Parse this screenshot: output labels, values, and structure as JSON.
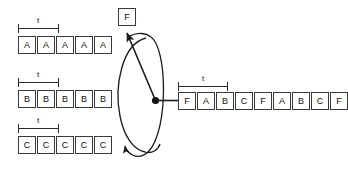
{
  "diagram": {
    "background_color": "#ffffff",
    "stroke_color": "#2b2b2b",
    "box_fill": "#ffffff",
    "period_label": "t"
  },
  "input_channels": [
    {
      "name": "channel-a",
      "symbol": "A",
      "cells": [
        "A",
        "A",
        "A",
        "A",
        "A"
      ],
      "bracket_label": "t"
    },
    {
      "name": "channel-b",
      "symbol": "B",
      "cells": [
        "B",
        "B",
        "B",
        "B",
        "B"
      ],
      "bracket_label": "t"
    },
    {
      "name": "channel-c",
      "symbol": "C",
      "cells": [
        "C",
        "C",
        "C",
        "C",
        "C"
      ],
      "bracket_label": "t"
    }
  ],
  "commutator": {
    "name": "rotating-switch",
    "frame_label": "F",
    "hub_label": "",
    "rotation_arrows": 2
  },
  "output_stream": {
    "name": "multiplexed-output",
    "cells": [
      "F",
      "A",
      "B",
      "C",
      "F",
      "A",
      "B",
      "C",
      "F"
    ],
    "bracket_label": "t",
    "bracket_span_cells": 4
  }
}
